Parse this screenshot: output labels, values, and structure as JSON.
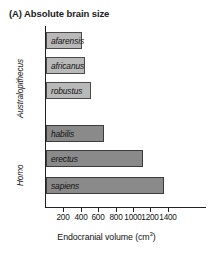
{
  "chart_data": {
    "type": "bar",
    "orientation": "horizontal",
    "title": "(A) Absolute brain size",
    "xlabel": "Endocranial volume (cm",
    "xlabel_sup": "3",
    "xlabel_tail": ")",
    "ylabel": "",
    "xlim": [
      0,
      1450
    ],
    "xticks": [
      200,
      400,
      600,
      800,
      1000,
      1200,
      1400
    ],
    "xtick_labels": [
      "200",
      "400",
      "600",
      "800",
      "1000",
      "1200",
      "1400"
    ],
    "grid": false,
    "legend": false,
    "groups": [
      {
        "name": "Australopithecus",
        "label": "Australopithecus"
      },
      {
        "name": "Homo",
        "label": "Homo"
      }
    ],
    "categories": [
      "afarensis",
      "africanus",
      "robustus",
      "habilis",
      "erectus",
      "sapiens"
    ],
    "values": [
      410,
      450,
      520,
      670,
      1115,
      1355
    ],
    "bars": [
      {
        "label": "afarensis",
        "value": 410,
        "group": "Australopithecus",
        "shade": "light"
      },
      {
        "label": "africanus",
        "value": 450,
        "group": "Australopithecus",
        "shade": "light"
      },
      {
        "label": "robustus",
        "value": 520,
        "group": "Australopithecus",
        "shade": "light"
      },
      {
        "label": "habilis",
        "value": 670,
        "group": "Homo",
        "shade": "dark"
      },
      {
        "label": "erectus",
        "value": 1115,
        "group": "Homo",
        "shade": "dark"
      },
      {
        "label": "sapiens",
        "value": 1355,
        "group": "Homo",
        "shade": "dark"
      }
    ],
    "colors": {
      "bar_light": "#b9b9b9",
      "bar_dark": "#8a8a8a",
      "bar_border": "#4a4a4a",
      "axis": "#222222",
      "text": "#111111",
      "background": "#ffffff"
    }
  }
}
